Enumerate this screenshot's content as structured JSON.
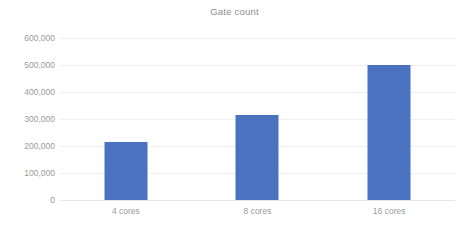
{
  "chart_data": {
    "type": "bar",
    "title": "Gate count",
    "categories": [
      "4 cores",
      "8 cores",
      "16 cores"
    ],
    "values": [
      215000,
      315000,
      500000
    ],
    "xlabel": "",
    "ylabel": "",
    "ylim": [
      0,
      600000
    ],
    "ytick_values": [
      0,
      100000,
      200000,
      300000,
      400000,
      500000,
      600000
    ],
    "ytick_labels": [
      "0",
      "100,000",
      "200,000",
      "300,000",
      "400,000",
      "500,000",
      "600,000"
    ],
    "grid": true,
    "legend": false,
    "bar_color": "#4a72c0",
    "grid_color": "#eceff3",
    "text_color": "#9a9a9a",
    "background": "#ffffff"
  }
}
